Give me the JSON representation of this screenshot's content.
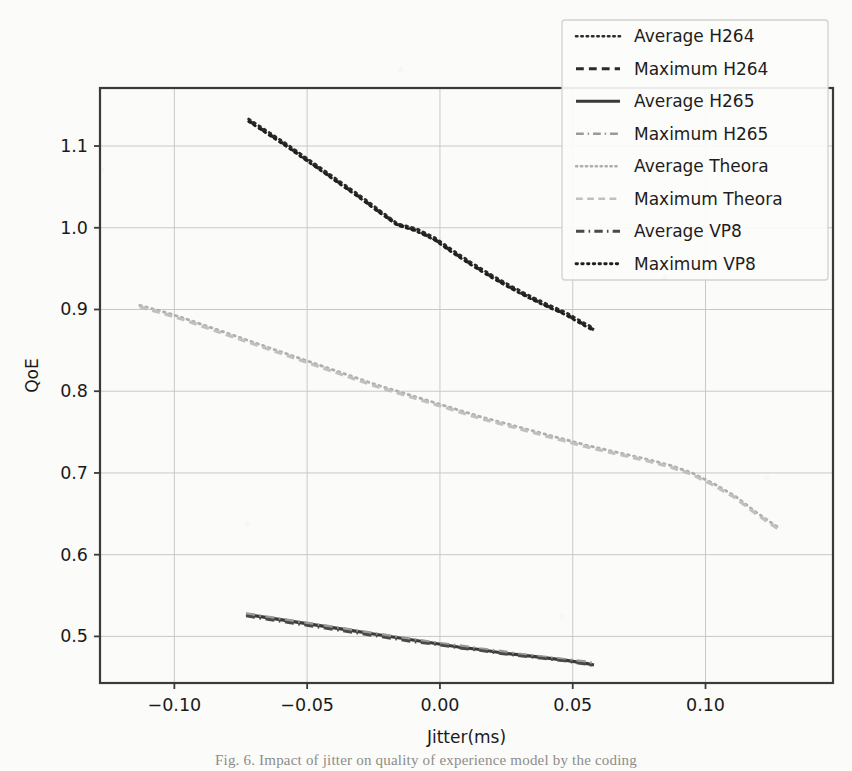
{
  "figure": {
    "background_color": "#fbfbf9",
    "axes_frame_color": "#3a3a3a",
    "grid_color": "#c9c9c4"
  },
  "axes": {
    "ylabel": "QoE",
    "xlabel": "Jitter(ms)",
    "xticks": [
      "-0.10",
      "-0.05",
      "0.00",
      "0.05",
      "0.10"
    ],
    "xtick_values": [
      -0.1,
      -0.05,
      0.0,
      0.05,
      0.1
    ],
    "yticks": [
      "0.5",
      "0.6",
      "0.7",
      "0.8",
      "0.9",
      "1.0",
      "1.1"
    ],
    "ytick_values": [
      0.5,
      0.6,
      0.7,
      0.8,
      0.9,
      1.0,
      1.1
    ],
    "xlim": [
      -0.128,
      0.148
    ],
    "ylim": [
      0.443,
      1.171
    ]
  },
  "legend": {
    "location": "upper right",
    "frame": true,
    "entries": [
      {
        "label": "Average H264",
        "style": "dotted",
        "color": "#2b2b2b",
        "width": 2.6
      },
      {
        "label": "Maximum H264",
        "style": "dashed",
        "color": "#2b2b2b",
        "width": 3.0
      },
      {
        "label": "Average H265",
        "style": "solid",
        "color": "#3a3a3a",
        "width": 3.0
      },
      {
        "label": "Maximum H265",
        "style": "dashdot",
        "color": "#9a9a97",
        "width": 2.6
      },
      {
        "label": "Average Theora",
        "style": "dotted",
        "color": "#aeaeab",
        "width": 2.4
      },
      {
        "label": "Maximum Theora",
        "style": "dashed",
        "color": "#c0c0bd",
        "width": 2.6
      },
      {
        "label": "Average VP8",
        "style": "dashdot",
        "color": "#4a4a4a",
        "width": 2.8
      },
      {
        "label": "Maximum VP8",
        "style": "dotted",
        "color": "#1f1f1f",
        "width": 2.8
      }
    ]
  },
  "chart_data": {
    "type": "line",
    "title": "",
    "xlabel": "Jitter(ms)",
    "ylabel": "QoE",
    "xlim": [
      -0.128,
      0.148
    ],
    "ylim": [
      0.443,
      1.171
    ],
    "grid": true,
    "legend_position": "upper right",
    "series": [
      {
        "name": "Average H264",
        "style": "dotted",
        "color": "#2b2b2b",
        "x": [
          -0.072,
          -0.065,
          -0.058,
          -0.051,
          -0.044,
          -0.037,
          -0.03,
          -0.023,
          -0.016,
          -0.009,
          -0.002,
          0.005,
          0.012,
          0.019,
          0.026,
          0.033,
          0.04,
          0.047,
          0.054,
          0.058
        ],
        "y": [
          1.133,
          1.118,
          1.103,
          1.087,
          1.071,
          1.055,
          1.039,
          1.022,
          1.005,
          0.999,
          0.988,
          0.972,
          0.957,
          0.943,
          0.93,
          0.918,
          0.907,
          0.897,
          0.884,
          0.877
        ]
      },
      {
        "name": "Maximum H264",
        "style": "dashed",
        "color": "#2b2b2b",
        "x": [
          -0.072,
          -0.065,
          -0.058,
          -0.051,
          -0.044,
          -0.037,
          -0.03,
          -0.023,
          -0.016,
          -0.009,
          -0.002,
          0.005,
          0.012,
          0.019,
          0.026,
          0.033,
          0.04,
          0.047,
          0.054,
          0.058
        ],
        "y": [
          1.131,
          1.116,
          1.101,
          1.085,
          1.069,
          1.053,
          1.037,
          1.02,
          1.004,
          0.997,
          0.986,
          0.97,
          0.955,
          0.941,
          0.928,
          0.916,
          0.905,
          0.895,
          0.882,
          0.875
        ]
      },
      {
        "name": "Average H265",
        "style": "solid",
        "color": "#3a3a3a",
        "x": [
          -0.073,
          -0.065,
          -0.057,
          -0.049,
          -0.041,
          -0.033,
          -0.025,
          -0.017,
          -0.009,
          -0.001,
          0.007,
          0.015,
          0.023,
          0.031,
          0.039,
          0.047,
          0.055,
          0.058
        ],
        "y": [
          0.527,
          0.523,
          0.519,
          0.515,
          0.511,
          0.507,
          0.503,
          0.499,
          0.495,
          0.491,
          0.487,
          0.484,
          0.48,
          0.477,
          0.474,
          0.471,
          0.467,
          0.465
        ]
      },
      {
        "name": "Maximum H265",
        "style": "dashdot",
        "color": "#9a9a97",
        "x": [
          -0.073,
          -0.065,
          -0.057,
          -0.049,
          -0.041,
          -0.033,
          -0.025,
          -0.017,
          -0.009,
          -0.001,
          0.007,
          0.015,
          0.023,
          0.031,
          0.039,
          0.047,
          0.055,
          0.058
        ],
        "y": [
          0.528,
          0.524,
          0.52,
          0.516,
          0.512,
          0.508,
          0.504,
          0.5,
          0.496,
          0.492,
          0.489,
          0.485,
          0.482,
          0.478,
          0.475,
          0.472,
          0.469,
          0.467
        ]
      },
      {
        "name": "Average Theora",
        "style": "dotted",
        "color": "#aeaeab",
        "x": [
          -0.113,
          -0.105,
          -0.097,
          -0.089,
          -0.081,
          -0.073,
          -0.065,
          -0.057,
          -0.049,
          -0.041,
          -0.033,
          -0.025,
          -0.017,
          -0.009,
          -0.001,
          0.007,
          0.015,
          0.023,
          0.031,
          0.039,
          0.047,
          0.055,
          0.063,
          0.071,
          0.079,
          0.087,
          0.095,
          0.103,
          0.111,
          0.119,
          0.128
        ],
        "y": [
          0.905,
          0.898,
          0.89,
          0.881,
          0.872,
          0.863,
          0.854,
          0.845,
          0.836,
          0.827,
          0.818,
          0.809,
          0.801,
          0.793,
          0.785,
          0.777,
          0.769,
          0.762,
          0.755,
          0.748,
          0.741,
          0.734,
          0.728,
          0.722,
          0.716,
          0.709,
          0.7,
          0.687,
          0.672,
          0.652,
          0.632
        ]
      },
      {
        "name": "Maximum Theora",
        "style": "dashed",
        "color": "#c0c0bd",
        "x": [
          -0.113,
          -0.105,
          -0.097,
          -0.089,
          -0.081,
          -0.073,
          -0.065,
          -0.057,
          -0.049,
          -0.041,
          -0.033,
          -0.025,
          -0.017,
          -0.009,
          -0.001,
          0.007,
          0.015,
          0.023,
          0.031,
          0.039,
          0.047,
          0.055,
          0.063,
          0.071,
          0.079,
          0.087,
          0.095,
          0.103,
          0.111,
          0.119,
          0.128
        ],
        "y": [
          0.903,
          0.896,
          0.888,
          0.879,
          0.87,
          0.861,
          0.852,
          0.843,
          0.834,
          0.825,
          0.816,
          0.807,
          0.799,
          0.791,
          0.783,
          0.775,
          0.767,
          0.76,
          0.753,
          0.746,
          0.739,
          0.732,
          0.726,
          0.72,
          0.714,
          0.707,
          0.698,
          0.685,
          0.67,
          0.65,
          0.63
        ]
      },
      {
        "name": "Average VP8",
        "style": "dashdot",
        "color": "#4a4a4a",
        "x": [
          -0.073,
          -0.065,
          -0.057,
          -0.049,
          -0.041,
          -0.033,
          -0.025,
          -0.017,
          -0.009,
          -0.001,
          0.007,
          0.015,
          0.023,
          0.031,
          0.039,
          0.047,
          0.055,
          0.058
        ],
        "y": [
          0.525,
          0.521,
          0.517,
          0.513,
          0.509,
          0.505,
          0.501,
          0.497,
          0.493,
          0.49,
          0.486,
          0.483,
          0.479,
          0.476,
          0.473,
          0.47,
          0.466,
          0.464
        ]
      },
      {
        "name": "Maximum VP8",
        "style": "dotted",
        "color": "#1f1f1f",
        "x": [
          -0.072,
          -0.065,
          -0.058,
          -0.051,
          -0.044,
          -0.037,
          -0.03,
          -0.023,
          -0.016,
          -0.009,
          -0.002,
          0.005,
          0.012,
          0.019,
          0.026,
          0.033,
          0.04,
          0.047,
          0.054,
          0.058
        ],
        "y": [
          1.13,
          1.115,
          1.1,
          1.084,
          1.068,
          1.052,
          1.036,
          1.019,
          1.003,
          0.996,
          0.985,
          0.969,
          0.954,
          0.94,
          0.927,
          0.915,
          0.904,
          0.894,
          0.881,
          0.874
        ]
      }
    ]
  },
  "page_footer": {
    "caption": "Fig. 6. Impact of jitter on quality of experience model by the coding"
  }
}
